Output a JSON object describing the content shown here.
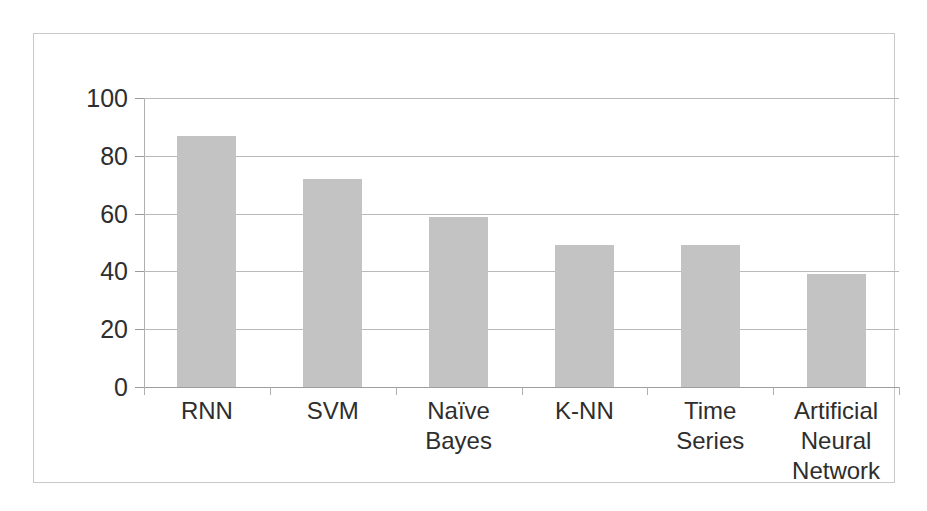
{
  "chart_data": {
    "type": "bar",
    "title": "",
    "subtitle": "",
    "xlabel": "",
    "ylabel": "",
    "categories": [
      "RNN",
      "SVM",
      "Naïve Bayes",
      "K-NN",
      "Time Series",
      "Artificial Neural Network"
    ],
    "values": [
      87,
      72,
      59,
      49,
      49,
      39
    ],
    "ylim": [
      0,
      100
    ],
    "yticks": [
      0,
      20,
      40,
      60,
      80,
      100
    ],
    "ytick_labels": [
      "0",
      "20",
      "40",
      "60",
      "80",
      "100"
    ],
    "grid": true,
    "grid_axis": "y",
    "legend": false,
    "legend_position": "none",
    "bar_color": "#c3c3c3",
    "gridline_color": "#b9b9b9",
    "axis_color": "#b0b0b0",
    "text_color": "#2e2e2e",
    "frame_color": "#c8c8c8",
    "background_color": "#ffffff",
    "data_labels": false
  },
  "category_label_lines": [
    [
      "RNN"
    ],
    [
      "SVM"
    ],
    [
      "Naïve",
      "Bayes"
    ],
    [
      "K-NN"
    ],
    [
      "Time Series"
    ],
    [
      "Artificial",
      "Neural",
      "Network"
    ]
  ]
}
